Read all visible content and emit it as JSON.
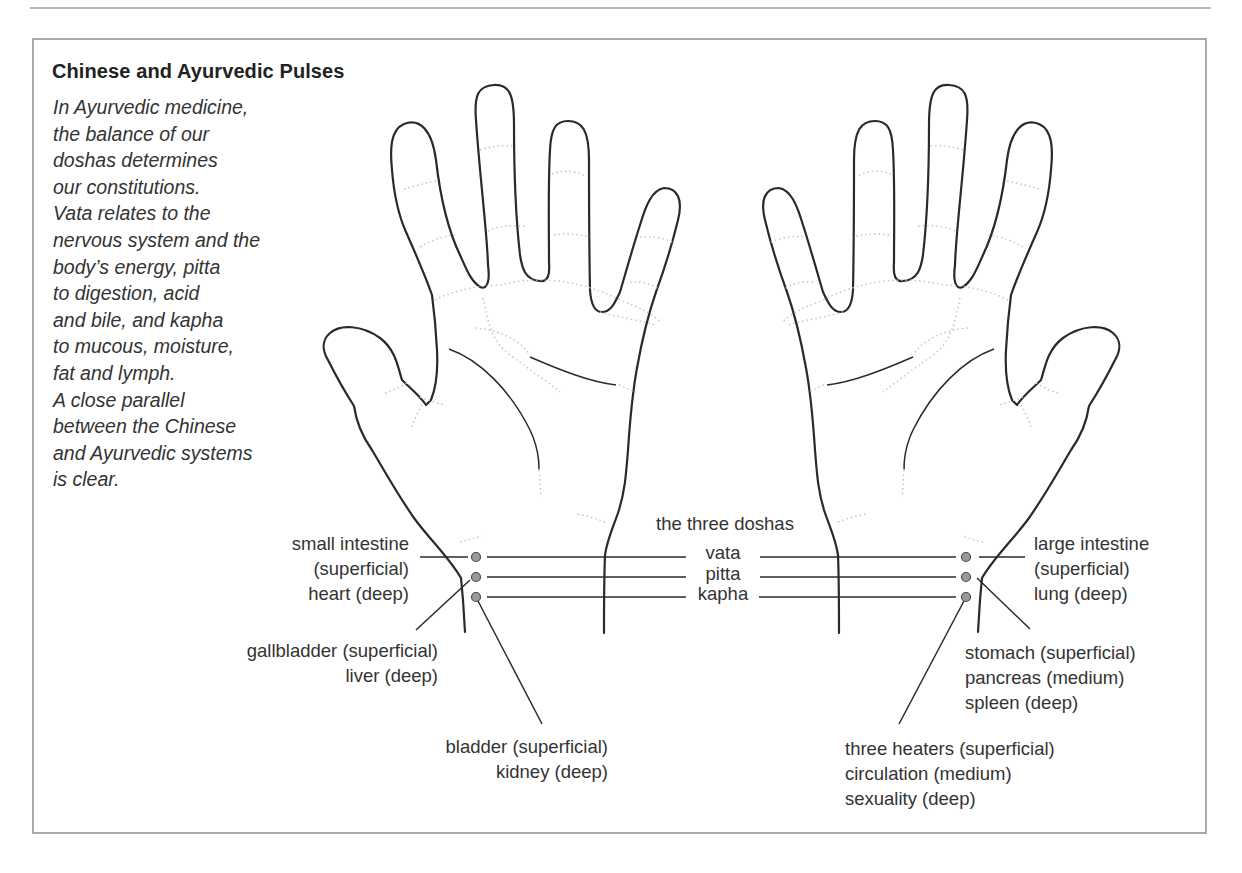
{
  "title": "Chinese and Ayurvedic Pulses",
  "intro_lines": [
    "In Ayurvedic medicine,",
    "the balance of our",
    "doshas determines",
    "our constitutions.",
    "Vata relates to the",
    "nervous system and the",
    "body’s energy, pitta",
    "to digestion, acid",
    "and bile, and kapha",
    "to mucous, moisture,",
    "fat and lymph.",
    "A close parallel",
    "between the Chinese",
    "and Ayurvedic systems",
    "is clear."
  ],
  "doshas": {
    "heading": "the three doshas",
    "items": [
      "vata",
      "pitta",
      "kapha"
    ]
  },
  "left_hand": {
    "pulse_1": [
      "small intestine",
      "(superficial)",
      "heart (deep)"
    ],
    "pulse_2": [
      "gallbladder (superficial)",
      "liver (deep)"
    ],
    "pulse_3": [
      "bladder (superficial)",
      "kidney (deep)"
    ]
  },
  "right_hand": {
    "pulse_1": [
      "large intestine",
      "(superficial)",
      "lung (deep)"
    ],
    "pulse_2": [
      "stomach (superficial)",
      "pancreas (medium)",
      "spleen (deep)"
    ],
    "pulse_3": [
      "three heaters (superficial)",
      "circulation (medium)",
      "sexuality (deep)"
    ]
  },
  "colors": {
    "line": "#2a2a2a",
    "pulse_dot": "#9a9a9a",
    "frame": "#a9a9a9",
    "crease": "#bdbdbd"
  }
}
